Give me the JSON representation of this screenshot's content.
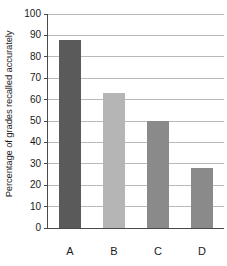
{
  "chart_data": {
    "type": "bar",
    "title": "",
    "subtitle": "",
    "xlabel": "",
    "ylabel": "Percentage of grades recalled accurately",
    "categories": [
      "A",
      "B",
      "C",
      "D"
    ],
    "values": [
      88,
      63,
      50,
      28
    ],
    "series": [
      {
        "name": "Percentage of grades recalled accurately",
        "values": [
          88,
          63,
          50,
          28
        ]
      }
    ],
    "bar_colors": [
      "#5a5a5a",
      "#b5b5b5",
      "#8a8a8a",
      "#8a8a8a"
    ],
    "ylim": [
      0,
      100
    ],
    "ytick_labels": [
      "0",
      "10",
      "20",
      "30",
      "40",
      "50",
      "60",
      "70",
      "80",
      "90",
      "100"
    ],
    "ytick_values": [
      0,
      10,
      20,
      30,
      40,
      50,
      60,
      70,
      80,
      90,
      100
    ],
    "grid": true,
    "grid_orientation": "horizontal",
    "grid_color": "#b9b9b9",
    "axis_color": "#4a4a4a",
    "legend": false,
    "legend_position": "none",
    "background_color": "#ffffff",
    "annotations": []
  }
}
